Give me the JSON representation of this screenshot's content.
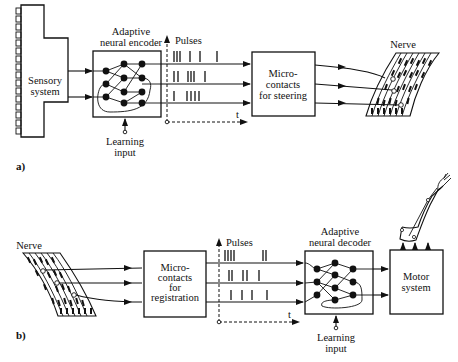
{
  "figure": {
    "panel_a": {
      "label": "a)",
      "sensory_system": {
        "line1": "Sensory",
        "line2": "system"
      },
      "encoder": {
        "title_line1": "Adaptive",
        "title_line2": "neural encoder",
        "learning_line1": "Learning",
        "learning_line2": "input"
      },
      "pulses_label": "Pulses",
      "time_label": "t",
      "microcontacts": {
        "line1": "Micro-",
        "line2": "contacts",
        "line3": "for steering"
      },
      "nerve_label": "Nerve"
    },
    "panel_b": {
      "label": "b)",
      "nerve_label": "Nerve",
      "microcontacts": {
        "line1": "Micro-",
        "line2": "contacts",
        "line3": "for",
        "line4": "registration"
      },
      "pulses_label": "Pulses",
      "time_label": "t",
      "decoder": {
        "title_line1": "Adaptive",
        "title_line2": "neural decoder",
        "learning_line1": "Learning",
        "learning_line2": "input"
      },
      "motor_system": {
        "line1": "Motor",
        "line2": "system"
      }
    }
  }
}
